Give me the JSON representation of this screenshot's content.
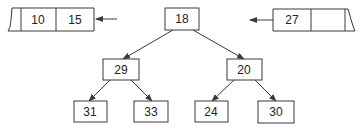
{
  "diagram": {
    "type": "binary-tree-with-queues",
    "left_queue": {
      "cells": [
        "",
        "10",
        "15"
      ],
      "arrow": "incoming-from-right"
    },
    "right_queue": {
      "cells": [
        "27",
        "",
        ""
      ],
      "arrow": "outgoing-to-left"
    },
    "tree": {
      "root": "18",
      "level1": [
        "29",
        "20"
      ],
      "level2": [
        "31",
        "33",
        "24",
        "30"
      ],
      "edges": [
        [
          "18",
          "29"
        ],
        [
          "18",
          "20"
        ],
        [
          "29",
          "31"
        ],
        [
          "29",
          "33"
        ],
        [
          "20",
          "24"
        ],
        [
          "20",
          "30"
        ]
      ]
    }
  },
  "colors": {
    "stroke": "#3a3a3a",
    "text": "#222222",
    "background": "#ffffff"
  }
}
